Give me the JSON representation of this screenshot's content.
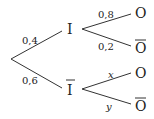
{
  "diagram": {
    "type": "probability-tree",
    "root": {
      "branches": [
        {
          "prob": "0,4",
          "node": "I",
          "overline": false,
          "branches": [
            {
              "prob": "0,8",
              "node": "O",
              "overline": false
            },
            {
              "prob": "0,2",
              "node": "O",
              "overline": true
            }
          ]
        },
        {
          "prob": "0,6",
          "node": "I",
          "overline": true,
          "branches": [
            {
              "prob": "x",
              "node": "O",
              "overline": false
            },
            {
              "prob": "y",
              "node": "O",
              "overline": true
            }
          ]
        }
      ]
    }
  }
}
